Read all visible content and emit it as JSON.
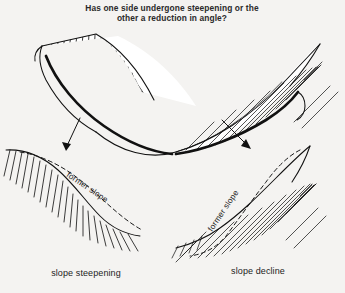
{
  "figure": {
    "title": "Has one side undergone steepening or the other a reduction in angle?",
    "title_line_1": "Has one side undergone steepening or the",
    "title_line_2": "other a reduction in angle?",
    "background_color": "#f4f3f1",
    "ink_color": "#111111"
  },
  "main_diagram": {
    "name": "asymmetric valley cross-section",
    "left_slope_label": "steep hachured slope",
    "right_slope_label": "gentle hatched slope"
  },
  "insets": [
    {
      "id": "left",
      "caption": "slope steepening",
      "annotation": "former slope",
      "annotation_rotation_deg": 34
    },
    {
      "id": "right",
      "caption": "slope decline",
      "annotation": "former slope",
      "annotation_rotation_deg": -56
    }
  ]
}
